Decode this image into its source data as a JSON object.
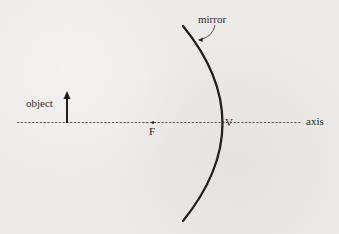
{
  "diagram": {
    "type": "curved-mirror-optics",
    "labels": {
      "mirror": "mirror",
      "object": "object",
      "focal_point": "F",
      "vertex": "V",
      "axis": "axis"
    },
    "colors": {
      "background": "#ecebe8",
      "ink": "#1e1e1e"
    }
  }
}
